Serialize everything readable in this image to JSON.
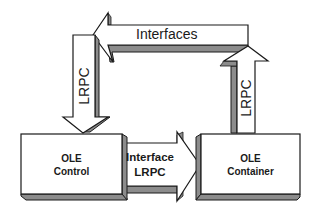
{
  "diagram": {
    "colors": {
      "stroke": "#1a1a1a",
      "fill": "#ffffff",
      "shadow": "#8c8c8c"
    },
    "nodes": [
      {
        "id": "ole-control",
        "lines": [
          "OLE",
          "Control"
        ]
      },
      {
        "id": "ole-container",
        "lines": [
          "OLE",
          "Container"
        ]
      }
    ],
    "arrows": [
      {
        "id": "interfaces",
        "label": "Interfaces",
        "direction": "left",
        "from": "ole-container",
        "to": "ole-control"
      },
      {
        "id": "lrpc-left",
        "label": "LRPC",
        "direction": "down",
        "to": "ole-control"
      },
      {
        "id": "lrpc-right",
        "label": "LRPC",
        "direction": "up",
        "from": "ole-container"
      },
      {
        "id": "interface-lrpc",
        "lines": [
          "Interface",
          "LRPC"
        ],
        "direction": "right",
        "from": "ole-control",
        "to": "ole-container"
      }
    ]
  }
}
